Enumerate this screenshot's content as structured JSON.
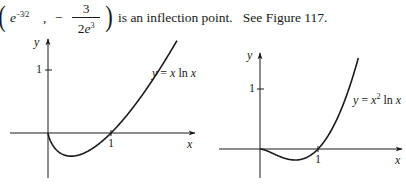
{
  "caption": {
    "point_x_base": "e",
    "point_x_exponent": "−3/2",
    "comma": ",",
    "minus": "−",
    "point_y_numerator": "3",
    "point_y_denominator_coef": "2",
    "point_y_denominator_base": "e",
    "point_y_denominator_exp": "3",
    "text": "is an inflection point.   See Figure 117."
  },
  "chart_data": [
    {
      "type": "line",
      "title": "y = x ln x",
      "function": "x*ln(x)",
      "xlabel": "x",
      "ylabel": "y",
      "x_ticks": [
        1
      ],
      "y_ticks": [
        1
      ],
      "key_points": [
        {
          "x": 0,
          "y": 0,
          "label": "origin"
        },
        {
          "x": 0.368,
          "y": -0.368,
          "label": "minimum (1/e, -1/e)"
        },
        {
          "x": 1,
          "y": 0,
          "label": "x-intercept"
        }
      ],
      "x_range": [
        -0.6,
        2.3
      ],
      "y_range": [
        -0.7,
        1.5
      ],
      "grid": false,
      "legend": "inline label right of curve"
    },
    {
      "type": "line",
      "title": "y = x² ln x",
      "function": "x^2*ln(x)",
      "xlabel": "x",
      "ylabel": "y",
      "x_ticks": [
        1
      ],
      "y_ticks": [
        1
      ],
      "key_points": [
        {
          "x": 0,
          "y": 0,
          "label": "origin"
        },
        {
          "x": 0.607,
          "y": -0.184,
          "label": "minimum (e^(-1/2), -1/(2e))"
        },
        {
          "x": 1,
          "y": 0,
          "label": "x-intercept"
        }
      ],
      "x_range": [
        -0.7,
        2.4
      ],
      "y_range": [
        -0.5,
        1.6
      ],
      "grid": false,
      "legend": "inline label right of curve"
    }
  ],
  "graphs": {
    "left": {
      "curve_label_y": "y",
      "curve_label_eq": "=",
      "curve_label_x": "x",
      "curve_label_fn": "ln",
      "curve_label_arg": "x",
      "y_axis_label": "y",
      "x_axis_label": "x",
      "y_tick": "1",
      "x_tick": "1"
    },
    "right": {
      "curve_label_y": "y",
      "curve_label_eq": "=",
      "curve_label_x": "x",
      "curve_label_sup": "2",
      "curve_label_fn": "ln",
      "curve_label_arg": "x",
      "y_axis_label": "y",
      "x_axis_label": "x",
      "y_tick": "1",
      "x_tick": "1"
    }
  }
}
